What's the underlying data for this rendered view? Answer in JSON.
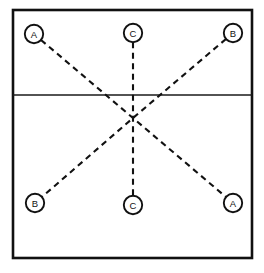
{
  "diagram": {
    "colors": {
      "background": "#ffffff",
      "stroke": "#111111",
      "divider": "#1a1a1a",
      "node_fill": "#ffffff"
    },
    "frame": {
      "name": "outer-rectangle",
      "x": 13,
      "y": 10,
      "width": 239,
      "height": 248,
      "stroke_width": 2.6
    },
    "divider": {
      "name": "horizontal-divider",
      "x1": 13,
      "y1": 95,
      "x2": 252,
      "y2": 95,
      "stroke_width": 1.5
    },
    "center_point": {
      "name": "intersection-point",
      "x": 133,
      "y": 118
    },
    "nodes": [
      {
        "id": "node-top-left",
        "label": "A",
        "cx": 34,
        "cy": 34,
        "r": 9.2
      },
      {
        "id": "node-top-center",
        "label": "C",
        "cx": 133,
        "cy": 33,
        "r": 9.2
      },
      {
        "id": "node-top-right",
        "label": "B",
        "cx": 233,
        "cy": 33,
        "r": 9.2
      },
      {
        "id": "node-bottom-left",
        "label": "B",
        "cx": 35,
        "cy": 203,
        "r": 9.2
      },
      {
        "id": "node-bottom-center",
        "label": "C",
        "cx": 133,
        "cy": 205,
        "r": 9.2
      },
      {
        "id": "node-bottom-right",
        "label": "A",
        "cx": 233,
        "cy": 203,
        "r": 9.2
      }
    ],
    "connections": [
      {
        "id": "line-a-to-a",
        "from": "node-top-left",
        "to": "node-bottom-right",
        "style": "dashed",
        "dash": "6,4.5"
      },
      {
        "id": "line-b-to-b",
        "from": "node-top-right",
        "to": "node-bottom-left",
        "style": "dashed",
        "dash": "6,4.5"
      },
      {
        "id": "line-c-to-c",
        "from": "node-top-center",
        "to": "node-bottom-center",
        "style": "dashed",
        "dash": "6,4.5"
      }
    ]
  }
}
